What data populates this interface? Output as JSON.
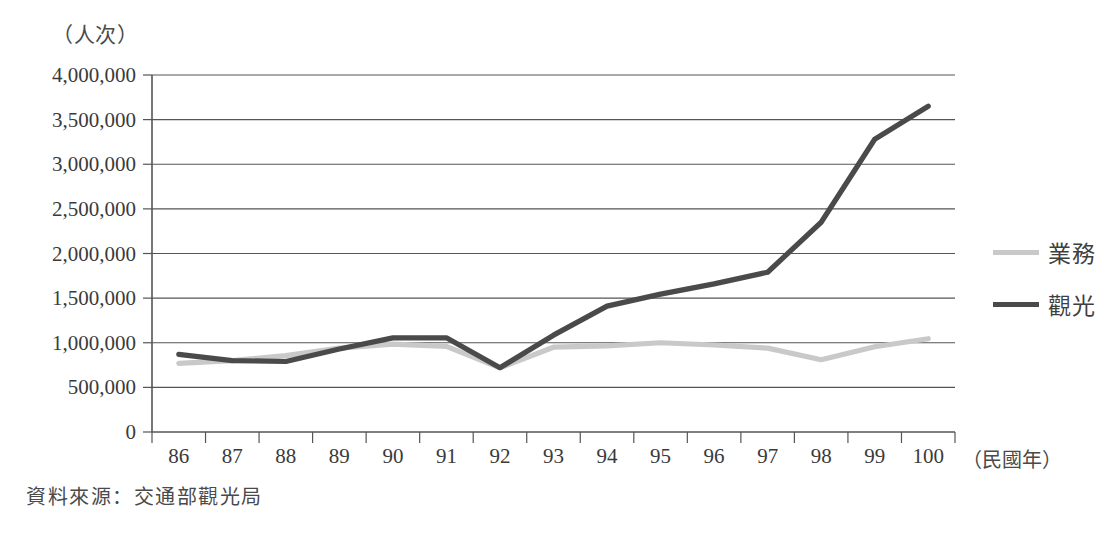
{
  "chart_data": {
    "type": "line",
    "title": "",
    "xlabel": "（民國年）",
    "ylabel": "（人次）",
    "categories": [
      "86",
      "87",
      "88",
      "89",
      "90",
      "91",
      "92",
      "93",
      "94",
      "95",
      "96",
      "97",
      "98",
      "99",
      "100"
    ],
    "ylim": [
      0,
      4000000
    ],
    "ytick_values": [
      0,
      500000,
      1000000,
      1500000,
      2000000,
      2500000,
      3000000,
      3500000,
      4000000
    ],
    "ytick_labels": [
      "0",
      "500,000",
      "1,000,000",
      "1,500,000",
      "2,000,000",
      "2,500,000",
      "3,000,000",
      "3,500,000",
      "4,000,000"
    ],
    "grid": true,
    "legend_position": "right",
    "series": [
      {
        "name": "業務",
        "color": "#c9c9c9",
        "values": [
          770000,
          800000,
          855000,
          940000,
          985000,
          960000,
          720000,
          950000,
          965000,
          1000000,
          975000,
          940000,
          810000,
          955000,
          1045000
        ]
      },
      {
        "name": "觀光",
        "color": "#4a4a4a",
        "values": [
          870000,
          800000,
          790000,
          930000,
          1055000,
          1055000,
          720000,
          1085000,
          1410000,
          1545000,
          1660000,
          1790000,
          2350000,
          3280000,
          3650000
        ]
      }
    ]
  },
  "axis": {
    "unit_label": "（人次）",
    "x_axis_title": "（民國年）"
  },
  "legend": {
    "items": [
      {
        "label": "業務",
        "color": "#c9c9c9"
      },
      {
        "label": "觀光",
        "color": "#4a4a4a"
      }
    ]
  },
  "footer": {
    "source": "資料來源：交通部觀光局"
  }
}
